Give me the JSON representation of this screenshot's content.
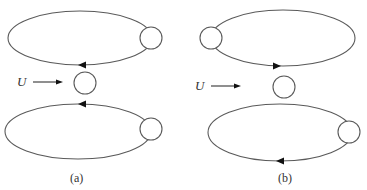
{
  "panels": [
    {
      "id": "a",
      "label": "(a)",
      "flow_label": "U",
      "upper_loop": {
        "direction": "counterclockwise",
        "arrow_at": "bottom",
        "arrow_points": "left",
        "circle_side": "right"
      },
      "lower_loop": {
        "direction": "clockwise",
        "arrow_at": "top",
        "arrow_points": "left",
        "circle_side": "right"
      },
      "center_body": "circle"
    },
    {
      "id": "b",
      "label": "(b)",
      "flow_label": "U",
      "upper_loop": {
        "direction": "counterclockwise",
        "arrow_at": "bottom",
        "arrow_points": "right",
        "circle_side": "left"
      },
      "lower_loop": {
        "direction": "clockwise",
        "arrow_at": "bottom",
        "arrow_points": "left",
        "circle_side": "right"
      },
      "center_body": "circle"
    }
  ],
  "colors": {
    "stroke": "#5a5a5a",
    "arrow": "#111111",
    "background": "#ffffff"
  }
}
